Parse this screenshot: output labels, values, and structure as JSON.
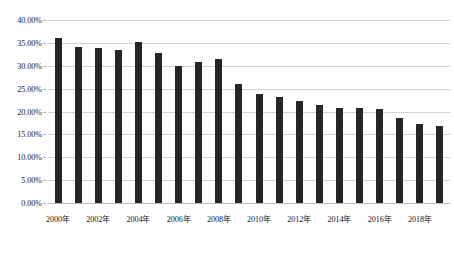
{
  "chart_data": {
    "type": "bar",
    "title": "",
    "subtitle": "",
    "xlabel": "",
    "ylabel": "",
    "categories": [
      "2000年",
      "2001年",
      "2002年",
      "2003年",
      "2004年",
      "2005年",
      "2006年",
      "2007年",
      "2008年",
      "2009年",
      "2010年",
      "2011年",
      "2012年",
      "2013年",
      "2014年",
      "2015年",
      "2016年",
      "2017年",
      "2018年",
      "2019年"
    ],
    "values": [
      36.0,
      34.0,
      33.9,
      33.4,
      35.2,
      32.7,
      30.0,
      30.9,
      31.4,
      26.0,
      23.9,
      23.2,
      22.4,
      21.4,
      20.7,
      20.8,
      20.6,
      18.6,
      17.3,
      16.8
    ],
    "value_labels": [
      "36.00%",
      "34.00%",
      "33.90%",
      "33.40%",
      "35.20%",
      "32.70%",
      "30.00%",
      "30.90%",
      "31.40%",
      "26.00%",
      "23.90%",
      "23.20%",
      "22.40%",
      "21.40%",
      "20.70%",
      "20.80%",
      "20.60%",
      "18.60%",
      "17.30%",
      "16.80%"
    ],
    "ylim": [
      0,
      40
    ],
    "ytick_values": [
      0,
      5,
      10,
      15,
      20,
      25,
      30,
      35,
      40
    ],
    "ytick_labels": [
      "0.00%",
      "5.00%",
      "10.00%",
      "15.00%",
      "20.00%",
      "25.00%",
      "30.00%",
      "35.00%",
      "40.00%"
    ],
    "xtick_labels": [
      "2000年",
      "2002年",
      "2004年",
      "2006年",
      "2008年",
      "2010年",
      "2012年",
      "2014年",
      "2016年",
      "2018年"
    ],
    "xtick_indices": [
      0,
      2,
      4,
      6,
      8,
      10,
      12,
      14,
      16,
      18
    ],
    "grid": true,
    "grid_axis": "y",
    "legend": false,
    "legend_position": "none",
    "series": [
      {
        "name": "",
        "color": "#262626",
        "values": [
          36.0,
          34.0,
          33.9,
          33.4,
          35.2,
          32.7,
          30.0,
          30.9,
          31.4,
          26.0,
          23.9,
          23.2,
          22.4,
          21.4,
          20.7,
          20.8,
          20.6,
          18.6,
          17.3,
          16.8
        ]
      }
    ],
    "colors": {
      "bar": "#262626",
      "gridline": "#d2d2d2",
      "baseline": "#bdbdbd",
      "text": "#1a1a1a",
      "background": "#ffffff"
    }
  }
}
